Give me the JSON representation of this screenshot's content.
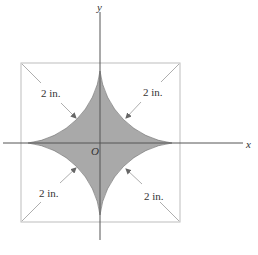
{
  "figure": {
    "axes": {
      "x_label": "x",
      "y_label": "y",
      "origin_label": "O"
    },
    "dimensions": [
      {
        "position": "top-left",
        "label": "2 in."
      },
      {
        "position": "top-right",
        "label": "2 in."
      },
      {
        "position": "bottom-left",
        "label": "2 in."
      },
      {
        "position": "bottom-right",
        "label": "2 in."
      }
    ],
    "colors": {
      "shaded_fill": "#a9a9a9",
      "shaded_edge": "#555555",
      "square_line": "#b8b8b8",
      "axis_line": "#555555",
      "arrow_line": "#999999",
      "text": "#333333"
    }
  }
}
